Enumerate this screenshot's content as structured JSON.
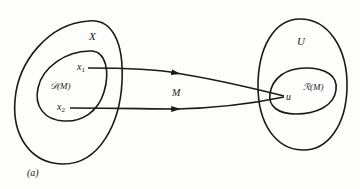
{
  "diagram": {
    "type": "mapping-diagram",
    "panel_label": "(a)",
    "domain_set": {
      "label": "X",
      "subset_label": "𝒟(M)",
      "points": [
        {
          "label": "x₁",
          "sub": "1"
        },
        {
          "label": "x₂",
          "sub": "2"
        }
      ]
    },
    "codomain_set": {
      "label": "U",
      "subset_label": "ℛ(M)",
      "point": "u"
    },
    "mapping_label": "M",
    "edges": [
      {
        "from": "x₁",
        "to": "u"
      },
      {
        "from": "x₂",
        "to": "u"
      }
    ],
    "colors": {
      "ink": "#1a1a1a",
      "paper": "#fdfdfb"
    }
  }
}
